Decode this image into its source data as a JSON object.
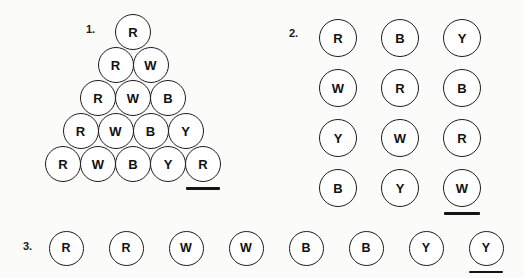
{
  "page": {
    "background_color": "#fbfbfa",
    "ink_color": "#141416",
    "token_fill": "#ffffff"
  },
  "panels": [
    {
      "id": "panel-1",
      "label": "1.",
      "layout": "triangle",
      "rows": [
        {
          "tokens": [
            {
              "letter": "R",
              "underlined": false
            }
          ]
        },
        {
          "tokens": [
            {
              "letter": "R",
              "underlined": false
            },
            {
              "letter": "W",
              "underlined": false
            }
          ]
        },
        {
          "tokens": [
            {
              "letter": "R",
              "underlined": false
            },
            {
              "letter": "W",
              "underlined": false
            },
            {
              "letter": "B",
              "underlined": false
            }
          ]
        },
        {
          "tokens": [
            {
              "letter": "R",
              "underlined": false
            },
            {
              "letter": "W",
              "underlined": false
            },
            {
              "letter": "B",
              "underlined": false
            },
            {
              "letter": "Y",
              "underlined": false
            }
          ]
        },
        {
          "tokens": [
            {
              "letter": "R",
              "underlined": false
            },
            {
              "letter": "W",
              "underlined": false
            },
            {
              "letter": "B",
              "underlined": false
            },
            {
              "letter": "Y",
              "underlined": false
            },
            {
              "letter": "R",
              "underlined": true
            }
          ]
        }
      ]
    },
    {
      "id": "panel-2",
      "label": "2.",
      "layout": "grid",
      "rows": [
        {
          "tokens": [
            {
              "letter": "R",
              "underlined": false
            },
            {
              "letter": "B",
              "underlined": false
            },
            {
              "letter": "Y",
              "underlined": false
            }
          ]
        },
        {
          "tokens": [
            {
              "letter": "W",
              "underlined": false
            },
            {
              "letter": "R",
              "underlined": false
            },
            {
              "letter": "B",
              "underlined": false
            }
          ]
        },
        {
          "tokens": [
            {
              "letter": "Y",
              "underlined": false
            },
            {
              "letter": "W",
              "underlined": false
            },
            {
              "letter": "R",
              "underlined": false
            }
          ]
        },
        {
          "tokens": [
            {
              "letter": "B",
              "underlined": false
            },
            {
              "letter": "Y",
              "underlined": false
            },
            {
              "letter": "W",
              "underlined": true
            }
          ]
        }
      ]
    },
    {
      "id": "panel-3",
      "label": "3.",
      "layout": "row",
      "rows": [
        {
          "tokens": [
            {
              "letter": "R",
              "underlined": false
            },
            {
              "letter": "R",
              "underlined": false
            },
            {
              "letter": "W",
              "underlined": false
            },
            {
              "letter": "W",
              "underlined": false
            },
            {
              "letter": "B",
              "underlined": false
            },
            {
              "letter": "B",
              "underlined": false
            },
            {
              "letter": "Y",
              "underlined": false
            },
            {
              "letter": "Y",
              "underlined": true
            }
          ]
        }
      ]
    }
  ],
  "geometry": {
    "panel1": {
      "label_x": 86,
      "label_y": 23,
      "top_cx": 133,
      "top_cy": 32,
      "dx": 35,
      "dy": 33,
      "size": 36
    },
    "panel2": {
      "label_x": 289,
      "label_y": 27,
      "first_cx": 338,
      "first_cy": 38,
      "dx": 62,
      "dy": 50,
      "size": 38
    },
    "panel3": {
      "label_x": 23,
      "label_y": 240,
      "first_cx": 66,
      "first_cy": 248,
      "dx": 60,
      "size": 35
    }
  }
}
